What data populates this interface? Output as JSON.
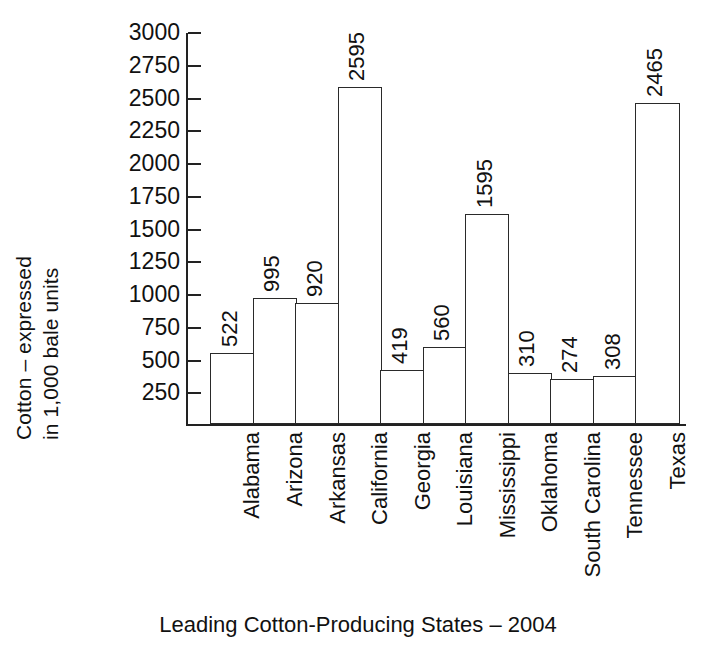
{
  "chart_data": {
    "type": "bar",
    "title": "",
    "xlabel": "Leading Cotton-Producing States – 2004",
    "ylabel_line1": "Cotton – expressed",
    "ylabel_line2": "in 1,000 bale units",
    "categories": [
      "Alabama",
      "Arizona",
      "Arkansas",
      "California",
      "Georgia",
      "Louisiana",
      "Mississippi",
      "Oklahoma",
      "South Carolina",
      "Tennessee",
      "Texas"
    ],
    "values": [
      522,
      995,
      920,
      2595,
      419,
      560,
      1595,
      310,
      274,
      308,
      2465
    ],
    "bar_pixel_values": [
      540,
      960,
      920,
      2570,
      415,
      590,
      1605,
      390,
      340,
      370,
      2450
    ],
    "ylim": [
      0,
      3000
    ],
    "yticks": [
      250,
      500,
      750,
      1000,
      1250,
      1500,
      1750,
      2000,
      2250,
      2500,
      2750,
      3000
    ],
    "ytick_labels": [
      "250",
      "500",
      "750",
      "1000",
      "1250",
      "1500",
      "1750",
      "2000",
      "2250",
      "2500",
      "2750",
      "3000"
    ],
    "grid": false,
    "legend": false,
    "bar_fill": "#ffffff",
    "bar_edge": "#2a2a2a",
    "axis_color": "#222222",
    "text_color": "#111111",
    "value_labels_shown": true,
    "value_label_orientation": "vertical"
  }
}
